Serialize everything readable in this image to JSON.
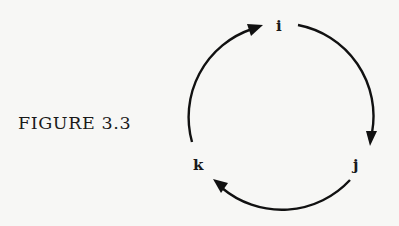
{
  "figure": {
    "caption": "FIGURE 3.3",
    "nodes": [
      {
        "id": "i",
        "label": "i"
      },
      {
        "id": "j",
        "label": "j"
      },
      {
        "id": "k",
        "label": "k"
      }
    ],
    "edges": [
      {
        "from": "i",
        "to": "j"
      },
      {
        "from": "j",
        "to": "k"
      },
      {
        "from": "k",
        "to": "i"
      }
    ],
    "layout": "cycle",
    "direction": "clockwise"
  }
}
